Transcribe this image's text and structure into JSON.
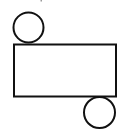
{
  "diagram": {
    "type": "cylinder-net",
    "stroke_color": "#111111",
    "background": "#ffffff",
    "shapes": {
      "top_circle": {
        "cx": 28.5,
        "cy": 27.5,
        "r": 15
      },
      "rectangle": {
        "x": 14,
        "y": 44.5,
        "width": 102,
        "height": 52
      },
      "bottom_circle": {
        "cx": 99.5,
        "cy": 112.5,
        "r": 15.5
      }
    }
  }
}
